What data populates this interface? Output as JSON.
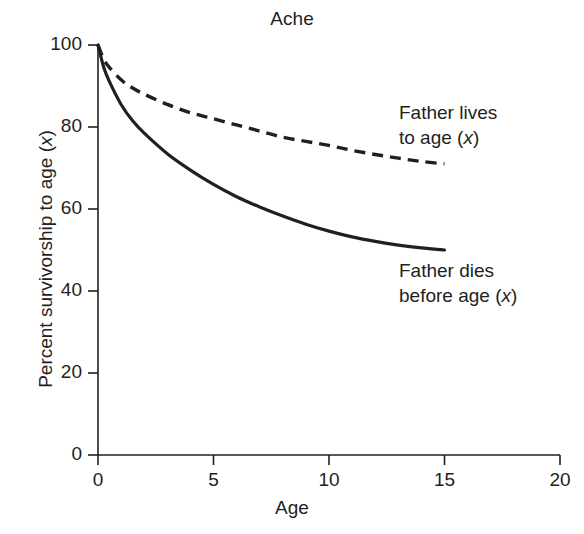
{
  "chart_data": {
    "type": "line",
    "title": "Ache",
    "xlabel": "Age",
    "ylabel": "Percent survivorship to age (x)",
    "xlim": [
      0,
      20
    ],
    "ylim": [
      0,
      100
    ],
    "xticks": [
      0,
      5,
      10,
      15,
      20
    ],
    "yticks": [
      0,
      20,
      40,
      60,
      80,
      100
    ],
    "grid": false,
    "legend_position": "inline-annotations",
    "series": [
      {
        "name": "Father lives to age (x)",
        "style": "dashed",
        "color": "#231f20",
        "x": [
          0,
          0.25,
          0.5,
          1,
          1.5,
          2,
          3,
          4,
          5,
          6,
          7,
          8,
          9,
          10,
          11,
          12,
          13,
          14,
          15
        ],
        "values": [
          100,
          96.5,
          94.5,
          91.5,
          89.5,
          88,
          85.5,
          83.5,
          82,
          80.5,
          79,
          77.5,
          76.5,
          75.5,
          74.3,
          73.3,
          72.4,
          71.6,
          71
        ]
      },
      {
        "name": "Father dies before age (x)",
        "style": "solid",
        "color": "#231f20",
        "x": [
          0,
          0.25,
          0.5,
          1,
          1.5,
          2,
          3,
          4,
          5,
          6,
          7,
          8,
          9,
          10,
          11,
          12,
          13,
          14,
          15
        ],
        "values": [
          100,
          94.5,
          91,
          85.5,
          81.5,
          78.5,
          73.5,
          69.5,
          66,
          63,
          60.5,
          58.3,
          56.3,
          54.6,
          53.2,
          52.1,
          51.2,
          50.5,
          50
        ]
      }
    ],
    "annotations": [
      {
        "text_line1": "Father lives",
        "text_line2_pre": "to age (",
        "text_line2_ital": "x",
        "text_line2_post": ")"
      },
      {
        "text_line1": "Father dies",
        "text_line2_pre": "before age (",
        "text_line2_ital": "x",
        "text_line2_post": ")"
      }
    ],
    "ylabel_pre": "Percent survivorship to age (",
    "ylabel_ital": "x",
    "ylabel_post": ")"
  }
}
